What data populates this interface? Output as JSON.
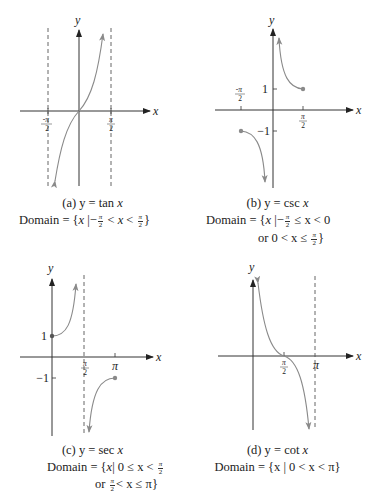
{
  "colors": {
    "axis": "#333333",
    "curve": "#8a8a8a",
    "asymptote": "#555555",
    "text": "#222222"
  },
  "panels": [
    {
      "id": "a",
      "title": "(a) y = tan x",
      "title_parts": {
        "prefix": "(a) y = ",
        "func": "tan",
        "var": "x"
      },
      "domain_lines": [
        "Domain = {x | -π/2 < x < π/2}"
      ],
      "axis_labels": {
        "x": "x",
        "y": "y"
      },
      "tick_labels": {
        "neg_pi_over_2": "-π/2",
        "pi_over_2": "π/2"
      },
      "domain": {
        "prefix": "Domain = {",
        "var": "x",
        "bar": "|",
        "minus": "−",
        "lt1": "<",
        "x2": "x",
        "lt2": "<",
        "close": "}",
        "pi": "π",
        "two": "2"
      }
    },
    {
      "id": "b",
      "title": "(b) y = csc x",
      "title_parts": {
        "prefix": "(b) y = ",
        "func": "csc",
        "var": "x"
      },
      "domain_lines": [
        "Domain = {x | -π/2 ≤ x < 0",
        "or 0 < x ≤ π/2}"
      ],
      "axis_labels": {
        "x": "x",
        "y": "y"
      },
      "tick_labels": {
        "neg_pi_over_2": "-π/2",
        "pi_over_2": "π/2",
        "one": "1",
        "neg_one": "−1"
      },
      "domain": {
        "prefix": "Domain = {",
        "var": "x",
        "bar": "|",
        "minus": "−",
        "rest1": "≤ x < 0",
        "or_line": "or 0 < x ≤",
        "close": "}",
        "pi": "π",
        "two": "2"
      }
    },
    {
      "id": "c",
      "title": "(c) y = sec x",
      "title_parts": {
        "prefix": "(c) y = ",
        "func": "sec",
        "var": "x"
      },
      "domain_lines": [
        "Domain = {x | 0 ≤ x < π/2",
        "or π/2 < x ≤ π}"
      ],
      "axis_labels": {
        "x": "x",
        "y": "y"
      },
      "tick_labels": {
        "pi_over_2": "π/2",
        "pi": "π",
        "one": "1",
        "neg_one": "−1"
      },
      "domain": {
        "prefix": "Domain = {",
        "var": "x",
        "bar": "|",
        "rest1": "0 ≤ x <",
        "or": "or",
        "rest2": "< x ≤ π",
        "close": "}",
        "pi": "π",
        "two": "2"
      }
    },
    {
      "id": "d",
      "title": "(d) y = cot x",
      "title_parts": {
        "prefix": "(d) y = ",
        "func": "cot",
        "var": "x"
      },
      "domain_lines": [
        "Domain = {x | 0 < x < π}"
      ],
      "axis_labels": {
        "x": "x",
        "y": "y"
      },
      "tick_labels": {
        "pi_over_2": "π/2",
        "pi": "π"
      },
      "domain": {
        "text": "Domain = {x | 0 < x < π}"
      }
    }
  ]
}
